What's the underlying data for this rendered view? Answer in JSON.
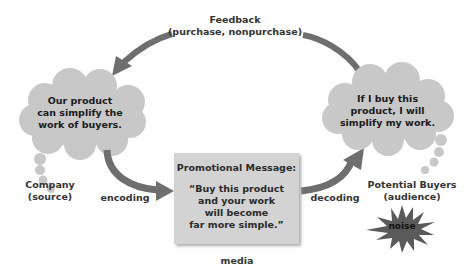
{
  "diagram": {
    "type": "communication-process",
    "feedback": {
      "label": "Feedback",
      "sublabel": "(purchase, nonpurchase)"
    },
    "source_cloud": {
      "lines": [
        "Our product",
        "can simplify the",
        "work of buyers."
      ]
    },
    "source_label": {
      "line1": "Company",
      "line2": "(source)"
    },
    "encoding_label": "encoding",
    "message": {
      "title": "Promotional Message:",
      "lines": [
        "“Buy this product",
        "and your work",
        "will become",
        "far more simple.”"
      ]
    },
    "media_label": "media",
    "decoding_label": "decoding",
    "receiver_cloud": {
      "lines": [
        "If I buy this",
        "product, I will",
        "simplify my work."
      ]
    },
    "receiver_label": {
      "line1": "Potential Buyers",
      "line2": "(audience)"
    },
    "noise_label": "noise",
    "colors": {
      "cloud": "#c8c8c8",
      "arrow": "#6e6e6e",
      "box": "#d3d3d3",
      "noise": "#5a5a5a"
    }
  }
}
